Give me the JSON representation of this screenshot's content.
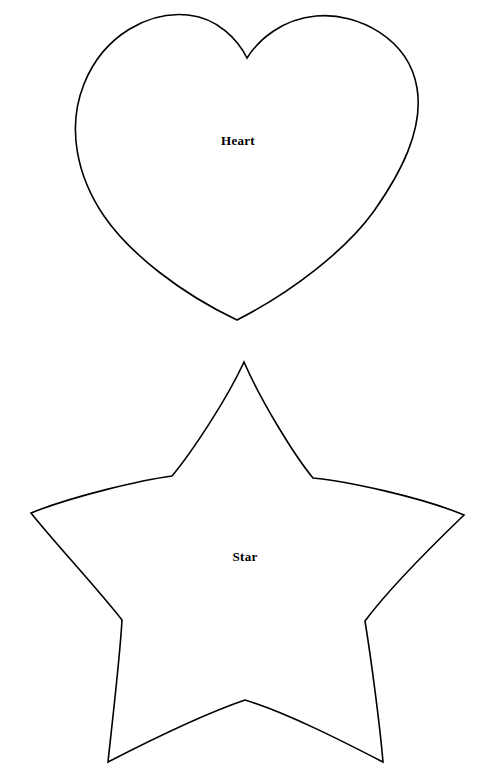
{
  "page": {
    "background_color": "#ffffff",
    "width": 485,
    "height": 777,
    "stroke_color": "#000000",
    "fill_color": "#ffffff"
  },
  "shapes": [
    {
      "id": "heart",
      "name": "heart-template",
      "label": "Heart",
      "label_position": {
        "x": 238,
        "y": 141
      },
      "bounds": {
        "left": 78,
        "top": 16,
        "right": 422,
        "bottom": 320
      },
      "features": {
        "top_cleft": {
          "x": 247,
          "y": 58
        },
        "left_lobe_peak": {
          "x": 158,
          "y": 16
        },
        "right_lobe_peak": {
          "x": 335,
          "y": 20
        },
        "bottom_tip": {
          "x": 237,
          "y": 320
        },
        "leftmost": {
          "x": 78,
          "y": 140
        },
        "rightmost": {
          "x": 422,
          "y": 142
        }
      }
    },
    {
      "id": "star",
      "name": "star-template",
      "label": "Star",
      "label_position": {
        "x": 245,
        "y": 557
      },
      "bounds": {
        "left": 31,
        "top": 362,
        "right": 464,
        "bottom": 762
      },
      "features": {
        "top_point": {
          "x": 244,
          "y": 362
        },
        "left_outer_point": {
          "x": 31,
          "y": 513
        },
        "right_outer_point": {
          "x": 464,
          "y": 515
        },
        "bottom_left_point": {
          "x": 108,
          "y": 762
        },
        "bottom_right_point": {
          "x": 383,
          "y": 762
        },
        "inner_upper_left": {
          "x": 172,
          "y": 476
        },
        "inner_upper_right": {
          "x": 313,
          "y": 478
        },
        "inner_lower_left": {
          "x": 122,
          "y": 620
        },
        "inner_lower_right": {
          "x": 365,
          "y": 621
        },
        "inner_bottom": {
          "x": 245,
          "y": 700
        }
      }
    }
  ]
}
